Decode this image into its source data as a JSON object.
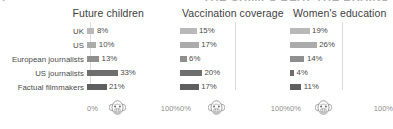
{
  "headline_fragment": "THE CHIMPS BEAT THE BRAINS",
  "headline_lead": "I",
  "axis": {
    "min_label": "0%",
    "max_label": "100%",
    "min_value": 0,
    "max_value": 100,
    "chimp_marker_label": "chimp-icon",
    "chimp_marker_value": 33,
    "gridline_value": 50
  },
  "row_labels": [
    "UK",
    "US",
    "European journalists",
    "US journalists",
    "Factual filmmakers"
  ],
  "bar_colors": [
    "#b9b9b9",
    "#ababab",
    "#8f8f8f",
    "#6e6e6e",
    "#5f5f5f"
  ],
  "chart_data": [
    {
      "type": "bar",
      "title": "Future children",
      "orientation": "horizontal",
      "categories": [
        "UK",
        "US",
        "European journalists",
        "US journalists",
        "Factual filmmakers"
      ],
      "values": [
        8,
        10,
        13,
        33,
        21
      ],
      "value_labels": [
        "8%",
        "10%",
        "13%",
        "33%",
        "21%"
      ],
      "xlabel": "",
      "ylabel": "",
      "xlim": [
        0,
        100
      ],
      "tick_labels": [
        "0%",
        "100%"
      ],
      "grid": true,
      "legend": "none"
    },
    {
      "type": "bar",
      "title": "Vaccination coverage",
      "orientation": "horizontal",
      "categories": [
        "UK",
        "US",
        "European journalists",
        "US journalists",
        "Factual filmmakers"
      ],
      "values": [
        15,
        17,
        6,
        20,
        17
      ],
      "value_labels": [
        "15%",
        "17%",
        "6%",
        "20%",
        "17%"
      ],
      "xlabel": "",
      "ylabel": "",
      "xlim": [
        0,
        100
      ],
      "tick_labels": [
        "0%",
        "100%"
      ],
      "grid": true,
      "legend": "none"
    },
    {
      "type": "bar",
      "title": "Women's education",
      "orientation": "horizontal",
      "categories": [
        "UK",
        "US",
        "European journalists",
        "US journalists",
        "Factual filmmakers"
      ],
      "values": [
        19,
        26,
        14,
        4,
        11
      ],
      "value_labels": [
        "19%",
        "26%",
        "14%",
        "4%",
        "11%"
      ],
      "xlabel": "",
      "ylabel": "",
      "xlim": [
        0,
        100
      ],
      "tick_labels": [
        "0%",
        "100%"
      ],
      "grid": true,
      "legend": "none"
    }
  ]
}
